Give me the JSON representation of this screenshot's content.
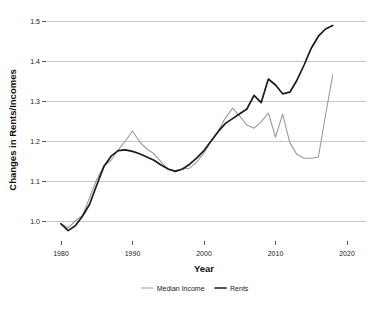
{
  "chart_data": {
    "type": "line",
    "title": "",
    "xlabel": "Year",
    "ylabel": "Changes in Rents/Incomes",
    "xlim": [
      1979,
      2021
    ],
    "ylim": [
      0.96,
      1.52
    ],
    "xticks": [
      1980,
      1990,
      2000,
      2010,
      2020
    ],
    "xtick_labels": [
      "1980",
      "1990",
      "2000",
      "2010",
      "2020"
    ],
    "yticks": [
      1.0,
      1.1,
      1.2,
      1.3,
      1.4,
      1.5
    ],
    "ytick_labels": [
      "1.0",
      "1.1",
      "1.2",
      "1.3",
      "1.4",
      "1.5"
    ],
    "grid": "horizontal",
    "legend_position": "bottom",
    "x": [
      1980,
      1981,
      1982,
      1983,
      1984,
      1985,
      1986,
      1987,
      1988,
      1989,
      1990,
      1991,
      1992,
      1993,
      1994,
      1995,
      1996,
      1997,
      1998,
      1999,
      2000,
      2001,
      2002,
      2003,
      2004,
      2005,
      2006,
      2007,
      2008,
      2009,
      2010,
      2011,
      2012,
      2013,
      2014,
      2015,
      2016,
      2017,
      2018
    ],
    "series": [
      {
        "name": "Median Income",
        "color": "#9a9a9a",
        "values": [
          0.993,
          0.983,
          1.0,
          1.012,
          1.055,
          1.103,
          1.137,
          1.152,
          1.17,
          1.196,
          1.225,
          1.196,
          1.178,
          1.17,
          1.147,
          1.128,
          1.126,
          1.13,
          1.132,
          1.145,
          1.16,
          1.192,
          1.215,
          1.248,
          1.272,
          1.283,
          1.264,
          1.248,
          1.232,
          1.236,
          1.254,
          1.27,
          1.21,
          1.267,
          1.218,
          1.174,
          1.157,
          1.156,
          1.158
        ]
      },
      {
        "name": "Rents",
        "color": "#1c1c1c",
        "values": [
          0.993,
          0.976,
          0.988,
          1.012,
          1.042,
          1.092,
          1.137,
          1.162,
          1.175,
          1.177,
          1.174,
          1.168,
          1.162,
          1.152,
          1.14,
          1.13,
          1.124,
          1.128,
          1.14,
          1.156,
          1.17,
          1.194,
          1.218,
          1.24,
          1.262,
          1.272,
          1.278,
          1.288,
          1.3,
          1.314,
          1.296,
          1.355,
          1.344,
          1.33,
          1.316,
          1.345,
          1.398,
          1.448,
          1.472
        ]
      }
    ],
    "series_tail_note": "gray series continues: 2013-2018 rises from 1.158 to 1.365; black series continues to 1.489 at 2018",
    "series_extended": [
      {
        "name": "Median Income",
        "x": [
          1980,
          1981,
          1982,
          1983,
          1984,
          1985,
          1986,
          1987,
          1988,
          1989,
          1990,
          1991,
          1992,
          1993,
          1994,
          1995,
          1996,
          1997,
          1998,
          1999,
          2000,
          2001,
          2002,
          2003,
          2004,
          2005,
          2006,
          2007,
          2008,
          2009,
          2010,
          2011,
          2012,
          2013,
          2014,
          2015,
          2016,
          2017,
          2018
        ],
        "values": [
          0.993,
          0.983,
          1.0,
          1.014,
          1.058,
          1.104,
          1.138,
          1.152,
          1.178,
          1.2,
          1.225,
          1.198,
          1.18,
          1.168,
          1.148,
          1.128,
          1.126,
          1.13,
          1.132,
          1.148,
          1.17,
          1.2,
          1.225,
          1.258,
          1.282,
          1.262,
          1.24,
          1.232,
          1.248,
          1.27,
          1.21,
          1.267,
          1.196,
          1.166,
          1.157,
          1.157,
          1.16,
          1.265,
          1.365
        ]
      },
      {
        "name": "Rents",
        "x": [
          1980,
          1981,
          1982,
          1983,
          1984,
          1985,
          1986,
          1987,
          1988,
          1989,
          1990,
          1991,
          1992,
          1993,
          1994,
          1995,
          1996,
          1997,
          1998,
          1999,
          2000,
          2001,
          2002,
          2003,
          2004,
          2005,
          2006,
          2007,
          2008,
          2009,
          2010,
          2011,
          2012,
          2013,
          2014,
          2015,
          2016,
          2017,
          2018
        ],
        "values": [
          0.993,
          0.976,
          0.988,
          1.012,
          1.042,
          1.09,
          1.136,
          1.162,
          1.176,
          1.178,
          1.174,
          1.168,
          1.16,
          1.152,
          1.14,
          1.13,
          1.124,
          1.13,
          1.142,
          1.158,
          1.176,
          1.2,
          1.224,
          1.244,
          1.256,
          1.268,
          1.28,
          1.314,
          1.296,
          1.355,
          1.34,
          1.318,
          1.322,
          1.352,
          1.39,
          1.432,
          1.462,
          1.48,
          1.489
        ]
      }
    ],
    "legend": [
      {
        "label": "Median Income",
        "color": "#9a9a9a"
      },
      {
        "label": "Rents",
        "color": "#1c1c1c"
      }
    ]
  }
}
